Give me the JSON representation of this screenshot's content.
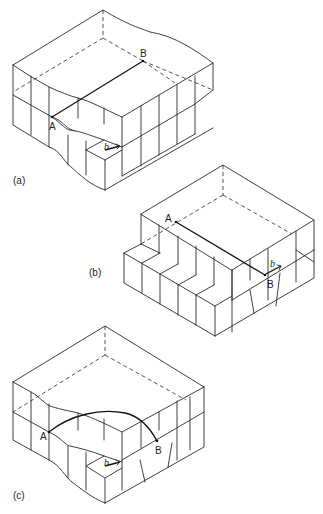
{
  "figure": {
    "panels": [
      {
        "id": "a",
        "caption": "(a)",
        "points": [
          "A",
          "B"
        ],
        "burgers_vector": "b",
        "description": "Crystal block with dislocation line AB running straight across the slip plane; partial slip region shown"
      },
      {
        "id": "b",
        "caption": "(b)",
        "points": [
          "A",
          "B"
        ],
        "burgers_vector": "b",
        "description": "Crystal block after slip with step on front face; dislocation line AB"
      },
      {
        "id": "c",
        "caption": "(c)",
        "points": [
          "A",
          "B"
        ],
        "burgers_vector": "b",
        "description": "Crystal block with curved dislocation line AB on slip plane"
      }
    ]
  },
  "labels": {
    "a_caption": "(a)",
    "b_caption": "(b)",
    "c_caption": "(c)",
    "a_A": "A",
    "a_B": "B",
    "a_b": "b",
    "b_A": "A",
    "b_B": "B",
    "b_b": "b",
    "c_A": "A",
    "c_B": "B",
    "c_b": "b"
  }
}
